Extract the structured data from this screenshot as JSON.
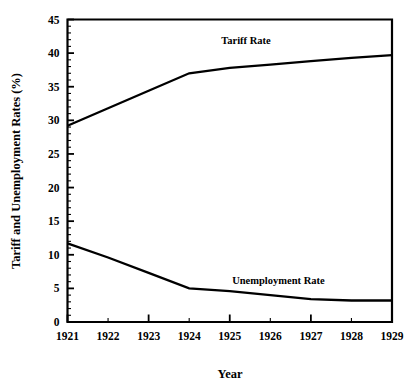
{
  "chart_data": {
    "type": "line",
    "title": "",
    "xlabel": "Year",
    "ylabel": "Tariff and Unemployment Rates (%)",
    "x": [
      1921,
      1922,
      1923,
      1924,
      1925,
      1926,
      1927,
      1928,
      1929
    ],
    "categories": [
      "1921",
      "1922",
      "1923",
      "1924",
      "1925",
      "1926",
      "1927",
      "1928",
      "1929"
    ],
    "xlim": [
      1921,
      1929
    ],
    "ylim": [
      0,
      45
    ],
    "grid": false,
    "legend_position": "inline-labels",
    "y_ticks": [
      0,
      5,
      10,
      15,
      20,
      25,
      30,
      35,
      40,
      45
    ],
    "y_tick_labels": [
      "0",
      "5",
      "10",
      "15",
      "20",
      "25",
      "30",
      "35",
      "40",
      "45"
    ],
    "y_minor_tick_step": 1,
    "x_major_ticks": [
      1921,
      1923,
      1925,
      1927,
      1929
    ],
    "x_minor_ticks": [
      1922,
      1924,
      1926,
      1928
    ],
    "x_tick_labels": [
      "1921",
      "1922",
      "1923",
      "1924",
      "1925",
      "1926",
      "1927",
      "1928",
      "1929"
    ],
    "series": [
      {
        "name": "Tariff Rate",
        "color": "#000000",
        "values": [
          29.2,
          31.8,
          34.4,
          37.0,
          37.8,
          38.3,
          38.8,
          39.3,
          39.7
        ],
        "label_x": 1925.4,
        "label_y": 41.3
      },
      {
        "name": "Unemployment Rate",
        "color": "#000000",
        "values": [
          11.7,
          9.6,
          7.3,
          5.0,
          4.6,
          4.0,
          3.4,
          3.2,
          3.2
        ],
        "label_x": 1926.2,
        "label_y": 5.6
      }
    ]
  },
  "axes": {
    "x_axis_title": "Year",
    "y_axis_title": "Tariff and Unemployment Rates (%)"
  },
  "labels": {
    "tariff_series_label": "Tariff Rate",
    "unemployment_series_label": "Unemployment Rate",
    "y_0": "0",
    "y_5": "5",
    "y_10": "10",
    "y_15": "15",
    "y_20": "20",
    "y_25": "25",
    "y_30": "30",
    "y_35": "35",
    "y_40": "40",
    "y_45": "45",
    "x_1921": "1921",
    "x_1922": "1922",
    "x_1923": "1923",
    "x_1924": "1924",
    "x_1925": "1925",
    "x_1926": "1926",
    "x_1927": "1927",
    "x_1928": "1928",
    "x_1929": "1929"
  },
  "colors": {
    "background": "#ffffff",
    "foreground": "#000000",
    "series_line": "#000000"
  }
}
